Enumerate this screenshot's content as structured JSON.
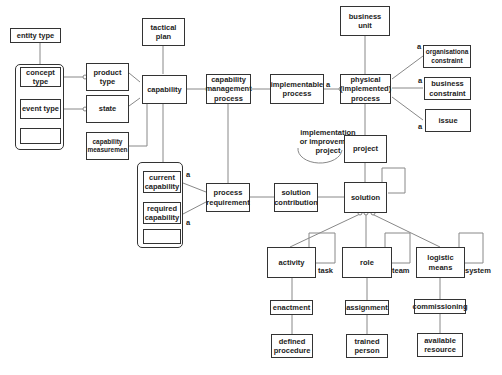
{
  "diagram": {
    "nodes": {
      "entity_type": "entity type",
      "concept_type": "concept type",
      "event_type": "event type",
      "product_type": "product type",
      "state": "state",
      "capability_measurement": "capability measuremen",
      "tactical_plan": "tactical plan",
      "capability": "capability",
      "capability_management_process": "capability management process",
      "implementable_process": "implementable process",
      "business_unit": "business unit",
      "physical_process": "physical (implemented) process",
      "organisational_constraint": "organisationa constraint",
      "business_constraint": "business constraint",
      "issue": "issue",
      "project": "project",
      "current_capability": "current capability",
      "required_capability": "required capability",
      "process_requirement": "process requirement",
      "solution_contribution": "solution contribution",
      "solution": "solution",
      "activity": "activity",
      "role": "role",
      "logistic_means": "logistic means",
      "enactment": "enactment",
      "assignment": "assignment",
      "commissioning": "commissioning",
      "defined_procedure": "defined procedure",
      "trained_person": "trained person",
      "available_resource": "available resource"
    },
    "labels": {
      "implementation_project": "implementation or improvement project",
      "task": "task",
      "team": "team",
      "system": "system",
      "a": "a"
    }
  }
}
